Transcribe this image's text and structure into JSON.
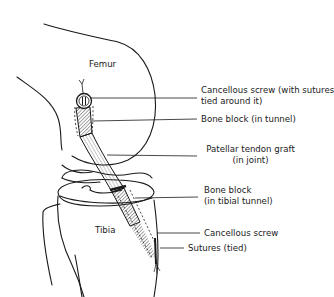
{
  "diagram": {
    "type": "anatomical-illustration",
    "structures": {
      "femur": "Femur",
      "tibia": "Tibia"
    },
    "callouts": [
      {
        "id": "cancellous-screw-femoral",
        "line1": "Cancellous screw (with sutures",
        "line2": "tied around it)"
      },
      {
        "id": "bone-block-femoral",
        "line1": "Bone block (in tunnel)"
      },
      {
        "id": "patellar-tendon-graft",
        "line1": "Patellar tendon graft",
        "line2": "(in joint)"
      },
      {
        "id": "bone-block-tibial",
        "line1": "Bone block",
        "line2": "(in tibial tunnel)"
      },
      {
        "id": "cancellous-screw-tibial",
        "line1": "Cancellous screw"
      },
      {
        "id": "sutures-tied",
        "line1": "Sutures (tied)"
      }
    ],
    "colors": {
      "ink": "#1a1a1a",
      "background": "#ffffff"
    }
  }
}
